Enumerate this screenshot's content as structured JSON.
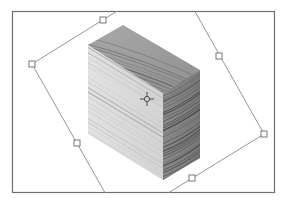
{
  "canvas": {
    "description": "Transform bounding box around a wood-textured block",
    "background_color": "#ffffff",
    "frame_color": "#707070",
    "handle_color": "#6a6a6a",
    "bbox_line_color": "#8a8a8a"
  },
  "object": {
    "name": "wood block",
    "texture": "wood-grain",
    "faces": [
      "top",
      "front",
      "side"
    ]
  },
  "transform": {
    "handle_count": 6,
    "center_point_icon": "crosshair-icon"
  }
}
